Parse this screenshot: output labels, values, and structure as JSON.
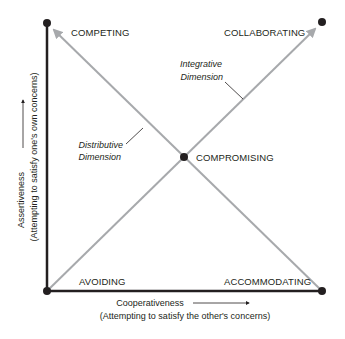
{
  "diagram": {
    "modes": {
      "competing": "COMPETING",
      "collaborating": "COLLABORATING",
      "compromising": "COMPROMISING",
      "avoiding": "AVOIDING",
      "accommodating": "ACCOMMODATING"
    },
    "dimensions": {
      "integrative_line1": "Integrative",
      "integrative_line2": "Dimension",
      "distributive_line1": "Distributive",
      "distributive_line2": "Dimension"
    },
    "x_axis": {
      "label": "Cooperativeness",
      "sublabel": "(Attempting to satisfy the other's concerns)"
    },
    "y_axis": {
      "label": "Assertiveness",
      "sublabel": "(Attempting to satisfy one's own concerns)"
    },
    "colors": {
      "axis": "#231f20",
      "dimension_line": "#a7a9ac",
      "text": "#231f20",
      "background": "#ffffff"
    }
  }
}
